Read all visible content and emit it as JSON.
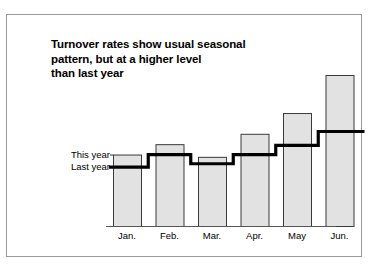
{
  "figure": {
    "title_lines": [
      "Turnover rates show usual seasonal",
      "pattern, but at a higher level",
      "than last year"
    ],
    "title_full": "Turnover rates show usual seasonal pattern, but at a higher level than last year",
    "legend_this_year": "This year",
    "legend_last_year": "Last year",
    "colors": {
      "bar_fill": "#e2e2e2",
      "bar_stroke": "#3a3a3a",
      "step_line": "#000000",
      "axis": "#555555",
      "frame": "#9a9a9a",
      "text": "#000000",
      "background": "#ffffff"
    }
  },
  "chart_data": {
    "type": "bar",
    "title": "Turnover rates show usual seasonal pattern, but at a higher level than last year",
    "subtitle": "",
    "xlabel": "",
    "ylabel": "",
    "grid": false,
    "legend_position": "inside-left",
    "categories": [
      "Jan.",
      "Feb.",
      "Mar.",
      "Apr.",
      "May",
      "Jun."
    ],
    "ylim": [
      0,
      100
    ],
    "series": [
      {
        "name": "This year",
        "render": "bars",
        "values": [
          62,
          71,
          60,
          80,
          98,
          131
        ]
      },
      {
        "name": "Last year",
        "render": "step-line",
        "values": [
          51,
          62,
          54,
          62,
          70,
          82
        ]
      }
    ],
    "annotations": [
      {
        "text": "This year",
        "target": "bars"
      },
      {
        "text": "Last year",
        "target": "step-line"
      }
    ]
  }
}
